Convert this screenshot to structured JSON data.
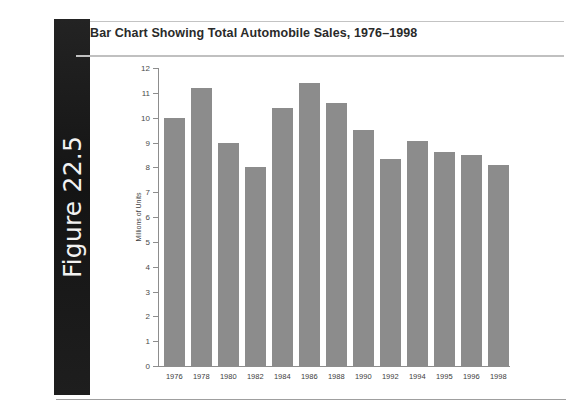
{
  "figure": {
    "tab_label": "Figure 22.5"
  },
  "chart_title": "Bar Chart Showing Total Automobile Sales, 1976–1998",
  "chart_data": {
    "type": "bar",
    "title": "Bar Chart Showing Total Automobile Sales, 1976–1998",
    "xlabel": "",
    "ylabel": "Millions of Units",
    "categories": [
      "1976",
      "1978",
      "1980",
      "1982",
      "1984",
      "1986",
      "1988",
      "1990",
      "1992",
      "1994",
      "1995",
      "1996",
      "1998"
    ],
    "values": [
      10.0,
      11.2,
      9.0,
      8.0,
      10.4,
      11.4,
      10.6,
      9.5,
      8.35,
      9.05,
      8.6,
      8.5,
      8.1
    ],
    "ylim": [
      0,
      12
    ],
    "ytick_labels": [
      "0",
      "1",
      "2",
      "3",
      "4",
      "5",
      "6",
      "7",
      "8",
      "9",
      "10",
      "11",
      "12"
    ],
    "ytick_values": [
      0,
      1,
      2,
      3,
      4,
      5,
      6,
      7,
      8,
      9,
      10,
      11,
      12
    ],
    "grid": false,
    "legend": "none",
    "bar_color": "#8c8c8c",
    "axis_color": "#8d8d8d"
  }
}
